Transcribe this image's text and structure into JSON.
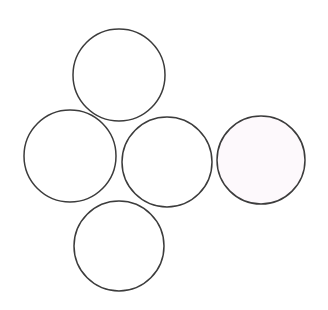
{
  "figure": {
    "background_color": "#ffffff",
    "width": 328,
    "height": 310
  },
  "chart_data": {
    "type": "scatter",
    "subtitle": "",
    "xlabel": "",
    "ylabel": "",
    "grid": false,
    "legend_position": "none",
    "axis_visible": false,
    "xlim": [
      0,
      328
    ],
    "ylim": [
      0,
      310
    ],
    "units": "pixels",
    "shape": "circle",
    "count": 5,
    "circles": [
      {
        "id": "top-circle",
        "label": "Top",
        "cx": 119,
        "cy": 75,
        "r": 46,
        "fill": "#ffffff",
        "stroke": "#3c3c3c",
        "stroke_width": 1.5
      },
      {
        "id": "left-circle",
        "label": "Left",
        "cx": 70,
        "cy": 156,
        "r": 46,
        "fill": "#ffffff",
        "stroke": "#3c3c3c",
        "stroke_width": 1.5
      },
      {
        "id": "center-circle",
        "label": "Center",
        "cx": 167,
        "cy": 162,
        "r": 45,
        "fill": "#ffffff",
        "stroke": "#3c3c3c",
        "stroke_width": 1.5
      },
      {
        "id": "bottom-circle",
        "label": "Bottom",
        "cx": 119,
        "cy": 246,
        "r": 45,
        "fill": "#ffffff",
        "stroke": "#3c3c3c",
        "stroke_width": 1.5
      },
      {
        "id": "right-circle",
        "label": "Right",
        "cx": 261,
        "cy": 160,
        "r": 44,
        "fill": "#fdf9fc",
        "stroke": "#3c3c3c",
        "stroke_width": 1.5
      }
    ]
  }
}
